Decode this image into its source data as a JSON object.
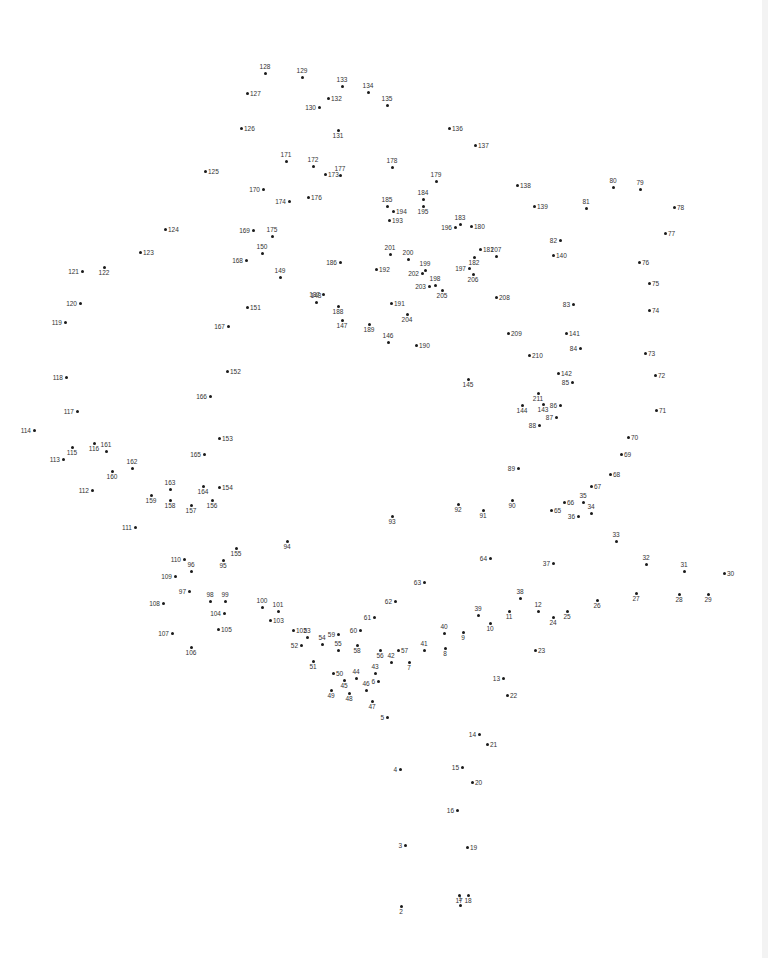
{
  "puzzle": {
    "title": "Dot-to-dot puzzle",
    "total_points": 211,
    "dot_color": "#1a1a1a",
    "label_color": "#333333",
    "background": "#ffffff",
    "points": [
      [
        1,
        460,
        905,
        "t"
      ],
      [
        2,
        401,
        906,
        "b"
      ],
      [
        3,
        405,
        845,
        "l"
      ],
      [
        4,
        400,
        769,
        "l"
      ],
      [
        5,
        387,
        717,
        "l"
      ],
      [
        6,
        378,
        681,
        "l"
      ],
      [
        7,
        409,
        662,
        "b"
      ],
      [
        8,
        445,
        648,
        "b"
      ],
      [
        9,
        463,
        632,
        "b"
      ],
      [
        10,
        490,
        623,
        "b"
      ],
      [
        11,
        509,
        611,
        "b"
      ],
      [
        12,
        538,
        611,
        "t"
      ],
      [
        13,
        503,
        678,
        "l"
      ],
      [
        14,
        479,
        734,
        "l"
      ],
      [
        15,
        462,
        767,
        "l"
      ],
      [
        16,
        457,
        810,
        "l"
      ],
      [
        17,
        459,
        895,
        "b"
      ],
      [
        18,
        468,
        895,
        "b"
      ],
      [
        19,
        467,
        847,
        "r"
      ],
      [
        20,
        472,
        782,
        "r"
      ],
      [
        21,
        487,
        744,
        "r"
      ],
      [
        22,
        507,
        695,
        "r"
      ],
      [
        23,
        535,
        650,
        "r"
      ],
      [
        24,
        553,
        617,
        "b"
      ],
      [
        25,
        567,
        611,
        "b"
      ],
      [
        26,
        597,
        600,
        "b"
      ],
      [
        27,
        636,
        593,
        "b"
      ],
      [
        28,
        679,
        594,
        "b"
      ],
      [
        29,
        708,
        594,
        "b"
      ],
      [
        30,
        724,
        573,
        "r"
      ],
      [
        31,
        684,
        571,
        "t"
      ],
      [
        32,
        646,
        564,
        "t"
      ],
      [
        33,
        616,
        541,
        "t"
      ],
      [
        34,
        591,
        513,
        "t"
      ],
      [
        35,
        583,
        502,
        "t"
      ],
      [
        36,
        578,
        516,
        "l"
      ],
      [
        37,
        553,
        563,
        "l"
      ],
      [
        38,
        520,
        598,
        "t"
      ],
      [
        39,
        478,
        615,
        "t"
      ],
      [
        40,
        444,
        633,
        "t"
      ],
      [
        41,
        424,
        650,
        "t"
      ],
      [
        42,
        391,
        662,
        "t"
      ],
      [
        43,
        375,
        673,
        "t"
      ],
      [
        44,
        356,
        678,
        "t"
      ],
      [
        45,
        344,
        680,
        "b"
      ],
      [
        46,
        366,
        690,
        "t"
      ],
      [
        47,
        372,
        701,
        "b"
      ],
      [
        48,
        349,
        693,
        "b"
      ],
      [
        49,
        331,
        690,
        "b"
      ],
      [
        50,
        333,
        673,
        "r"
      ],
      [
        51,
        313,
        661,
        "b"
      ],
      [
        52,
        301,
        645,
        "l"
      ],
      [
        53,
        307,
        637,
        "t"
      ],
      [
        54,
        322,
        644,
        "t"
      ],
      [
        55,
        338,
        650,
        "t"
      ],
      [
        56,
        380,
        650,
        "b"
      ],
      [
        57,
        398,
        650,
        "r"
      ],
      [
        58,
        357,
        645,
        "b"
      ],
      [
        59,
        338,
        634,
        "l"
      ],
      [
        60,
        360,
        630,
        "l"
      ],
      [
        61,
        374,
        617,
        "l"
      ],
      [
        62,
        395,
        601,
        "l"
      ],
      [
        63,
        424,
        582,
        "l"
      ],
      [
        64,
        490,
        558,
        "l"
      ],
      [
        65,
        551,
        510,
        "r"
      ],
      [
        66,
        564,
        502,
        "r"
      ],
      [
        67,
        591,
        486,
        "r"
      ],
      [
        68,
        610,
        474,
        "r"
      ],
      [
        69,
        621,
        454,
        "r"
      ],
      [
        70,
        628,
        437,
        "r"
      ],
      [
        71,
        656,
        410,
        "r"
      ],
      [
        72,
        655,
        375,
        "r"
      ],
      [
        73,
        645,
        353,
        "r"
      ],
      [
        74,
        649,
        310,
        "r"
      ],
      [
        75,
        649,
        283,
        "r"
      ],
      [
        76,
        639,
        262,
        "r"
      ],
      [
        77,
        665,
        233,
        "r"
      ],
      [
        78,
        674,
        207,
        "r"
      ],
      [
        79,
        640,
        189,
        "t"
      ],
      [
        80,
        613,
        187,
        "t"
      ],
      [
        81,
        586,
        208,
        "t"
      ],
      [
        82,
        560,
        240,
        "l"
      ],
      [
        83,
        573,
        304,
        "l"
      ],
      [
        84,
        580,
        348,
        "l"
      ],
      [
        85,
        572,
        382,
        "l"
      ],
      [
        86,
        560,
        405,
        "l"
      ],
      [
        87,
        556,
        417,
        "l"
      ],
      [
        88,
        539,
        425,
        "l"
      ],
      [
        89,
        518,
        468,
        "l"
      ],
      [
        90,
        512,
        500,
        "b"
      ],
      [
        91,
        483,
        510,
        "b"
      ],
      [
        92,
        458,
        504,
        "b"
      ],
      [
        93,
        392,
        516,
        "b"
      ],
      [
        94,
        287,
        541,
        "b"
      ],
      [
        95,
        223,
        560,
        "b"
      ],
      [
        96,
        191,
        571,
        "t"
      ],
      [
        97,
        189,
        591,
        "l"
      ],
      [
        98,
        210,
        601,
        "t"
      ],
      [
        99,
        225,
        601,
        "t"
      ],
      [
        100,
        262,
        607,
        "t"
      ],
      [
        101,
        278,
        611,
        "t"
      ],
      [
        102,
        293,
        630,
        "r"
      ],
      [
        103,
        270,
        620,
        "r"
      ],
      [
        104,
        224,
        613,
        "l"
      ],
      [
        105,
        218,
        629,
        "r"
      ],
      [
        106,
        191,
        647,
        "b"
      ],
      [
        107,
        172,
        633,
        "l"
      ],
      [
        108,
        163,
        603,
        "l"
      ],
      [
        109,
        175,
        576,
        "l"
      ],
      [
        110,
        184,
        559,
        "l"
      ],
      [
        111,
        135,
        527,
        "l"
      ],
      [
        112,
        92,
        490,
        "l"
      ],
      [
        113,
        63,
        459,
        "l"
      ],
      [
        114,
        34,
        430,
        "l"
      ],
      [
        115,
        72,
        447,
        "b"
      ],
      [
        116,
        94,
        443,
        "b"
      ],
      [
        117,
        77,
        411,
        "l"
      ],
      [
        118,
        66,
        377,
        "l"
      ],
      [
        119,
        65,
        322,
        "l"
      ],
      [
        120,
        80,
        303,
        "l"
      ],
      [
        121,
        82,
        271,
        "l"
      ],
      [
        122,
        104,
        267,
        "b"
      ],
      [
        123,
        140,
        252,
        "r"
      ],
      [
        124,
        165,
        229,
        "r"
      ],
      [
        125,
        205,
        171,
        "r"
      ],
      [
        126,
        241,
        128,
        "r"
      ],
      [
        127,
        247,
        93,
        "r"
      ],
      [
        128,
        265,
        73,
        "t"
      ],
      [
        129,
        302,
        77,
        "t"
      ],
      [
        130,
        319,
        107,
        "l"
      ],
      [
        131,
        338,
        130,
        "b"
      ],
      [
        132,
        328,
        98,
        "r"
      ],
      [
        133,
        342,
        86,
        "t"
      ],
      [
        134,
        368,
        92,
        "t"
      ],
      [
        135,
        387,
        105,
        "t"
      ],
      [
        136,
        449,
        128,
        "r"
      ],
      [
        137,
        475,
        145,
        "r"
      ],
      [
        138,
        517,
        185,
        "r"
      ],
      [
        139,
        534,
        206,
        "r"
      ],
      [
        140,
        553,
        255,
        "r"
      ],
      [
        141,
        566,
        333,
        "r"
      ],
      [
        142,
        558,
        373,
        "r"
      ],
      [
        143,
        543,
        404,
        "b"
      ],
      [
        144,
        522,
        405,
        "b"
      ],
      [
        145,
        468,
        379,
        "b"
      ],
      [
        146,
        388,
        342,
        "t"
      ],
      [
        147,
        342,
        320,
        "b"
      ],
      [
        148,
        316,
        302,
        "t"
      ],
      [
        149,
        280,
        277,
        "t"
      ],
      [
        150,
        262,
        253,
        "t"
      ],
      [
        151,
        247,
        307,
        "r"
      ],
      [
        152,
        227,
        371,
        "r"
      ],
      [
        153,
        219,
        438,
        "r"
      ],
      [
        154,
        219,
        487,
        "r"
      ],
      [
        155,
        236,
        548,
        "b"
      ],
      [
        156,
        212,
        500,
        "b"
      ],
      [
        157,
        191,
        505,
        "b"
      ],
      [
        158,
        170,
        500,
        "b"
      ],
      [
        159,
        151,
        495,
        "b"
      ],
      [
        160,
        112,
        471,
        "b"
      ],
      [
        161,
        106,
        451,
        "t"
      ],
      [
        162,
        132,
        468,
        "t"
      ],
      [
        163,
        170,
        489,
        "t"
      ],
      [
        164,
        203,
        486,
        "b"
      ],
      [
        165,
        204,
        454,
        "l"
      ],
      [
        166,
        210,
        396,
        "l"
      ],
      [
        167,
        228,
        326,
        "l"
      ],
      [
        168,
        246,
        260,
        "l"
      ],
      [
        169,
        253,
        230,
        "l"
      ],
      [
        170,
        263,
        189,
        "l"
      ],
      [
        171,
        286,
        161,
        "t"
      ],
      [
        172,
        313,
        166,
        "t"
      ],
      [
        173,
        325,
        174,
        "r"
      ],
      [
        174,
        289,
        201,
        "l"
      ],
      [
        175,
        272,
        236,
        "t"
      ],
      [
        176,
        308,
        197,
        "r"
      ],
      [
        177,
        340,
        175,
        "t"
      ],
      [
        178,
        392,
        167,
        "t"
      ],
      [
        179,
        436,
        181,
        "t"
      ],
      [
        180,
        471,
        226,
        "r"
      ],
      [
        181,
        480,
        249,
        "r"
      ],
      [
        182,
        474,
        257,
        "b"
      ],
      [
        183,
        460,
        224,
        "t"
      ],
      [
        184,
        423,
        199,
        "t"
      ],
      [
        185,
        387,
        206,
        "t"
      ],
      [
        186,
        340,
        262,
        "l"
      ],
      [
        187,
        323,
        294,
        "l"
      ],
      [
        188,
        338,
        306,
        "b"
      ],
      [
        189,
        369,
        324,
        "b"
      ],
      [
        190,
        416,
        345,
        "r"
      ],
      [
        191,
        391,
        303,
        "r"
      ],
      [
        192,
        376,
        269,
        "r"
      ],
      [
        193,
        389,
        220,
        "r"
      ],
      [
        194,
        393,
        211,
        "r"
      ],
      [
        195,
        423,
        206,
        "b"
      ],
      [
        196,
        455,
        227,
        "l"
      ],
      [
        197,
        469,
        268,
        "l"
      ],
      [
        198,
        435,
        285,
        "t"
      ],
      [
        199,
        425,
        270,
        "t"
      ],
      [
        200,
        408,
        259,
        "t"
      ],
      [
        201,
        390,
        254,
        "t"
      ],
      [
        202,
        422,
        273,
        "l"
      ],
      [
        203,
        429,
        286,
        "l"
      ],
      [
        204,
        407,
        314,
        "b"
      ],
      [
        205,
        442,
        290,
        "b"
      ],
      [
        206,
        473,
        274,
        "b"
      ],
      [
        207,
        496,
        256,
        "t"
      ],
      [
        208,
        496,
        297,
        "r"
      ],
      [
        209,
        508,
        333,
        "r"
      ],
      [
        210,
        529,
        355,
        "r"
      ],
      [
        211,
        538,
        393,
        "b"
      ]
    ]
  }
}
